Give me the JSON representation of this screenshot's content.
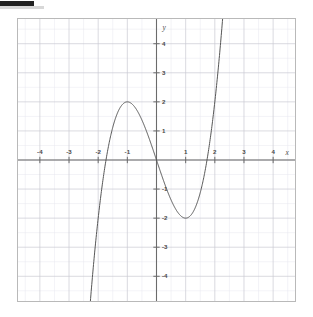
{
  "chart_data": {
    "type": "line",
    "title": "",
    "subtitle": "",
    "xlabel": "x",
    "ylabel": "y",
    "function": "y = x^3 - 3x",
    "xlim": [
      -4.75,
      4.75
    ],
    "ylim": [
      -4.85,
      4.85
    ],
    "grid": true,
    "grid_major_step": 1,
    "grid_minor_step": 0.5,
    "legend": "none",
    "x_ticks": [
      -4,
      -3,
      -2,
      -1,
      1,
      2,
      3,
      4
    ],
    "x_tick_labels": [
      "-4",
      "-3",
      "-2",
      "-1",
      "1",
      "2",
      "3",
      "4"
    ],
    "y_ticks": [
      4,
      3,
      2,
      1,
      -1,
      -2,
      -3,
      -4
    ],
    "y_tick_labels": [
      "4",
      "3",
      "2",
      "1",
      "-1",
      "-2",
      "-3",
      "-4"
    ],
    "series": [
      {
        "name": "y = x^3 - 3x",
        "color": "#555555",
        "x": [
          -2.0,
          -1.9,
          -1.8,
          -1.7321,
          -1.7,
          -1.6,
          -1.5,
          -1.4,
          -1.3,
          -1.2,
          -1.1,
          -1.0,
          -0.9,
          -0.8,
          -0.7,
          -0.6,
          -0.5,
          -0.4,
          -0.3,
          -0.2,
          -0.1,
          0.0,
          0.1,
          0.2,
          0.3,
          0.4,
          0.5,
          0.6,
          0.7,
          0.8,
          0.9,
          1.0,
          1.1,
          1.2,
          1.3,
          1.4,
          1.5,
          1.6,
          1.7,
          1.7321,
          1.8,
          1.9,
          2.0
        ],
        "y": [
          -2.0,
          -0.859,
          -0.432,
          0.0,
          0.187,
          0.704,
          1.125,
          1.456,
          1.703,
          1.872,
          1.969,
          2.0,
          1.971,
          1.888,
          1.757,
          1.584,
          1.375,
          1.136,
          0.873,
          0.592,
          0.299,
          0.0,
          -0.299,
          -0.592,
          -0.873,
          -1.136,
          -1.375,
          -1.584,
          -1.757,
          -1.888,
          -1.971,
          -2.0,
          -1.969,
          -1.872,
          -1.703,
          -1.456,
          -1.125,
          -0.704,
          -0.187,
          0.0,
          0.432,
          0.859,
          2.0
        ]
      }
    ],
    "key_points": {
      "local_maximum": {
        "x": -1,
        "y": 2
      },
      "local_minimum": {
        "x": 1,
        "y": -2
      },
      "roots": [
        -1.7321,
        0,
        1.7321
      ],
      "inflection": {
        "x": 0,
        "y": 0
      }
    },
    "colors": {
      "curve": "#555555",
      "axis": "#6b6b6b",
      "grid_major": "#c9c9d2",
      "grid_minor": "#e6e6ee",
      "border": "#b9b9b9",
      "label": "#4a4a4a"
    }
  }
}
